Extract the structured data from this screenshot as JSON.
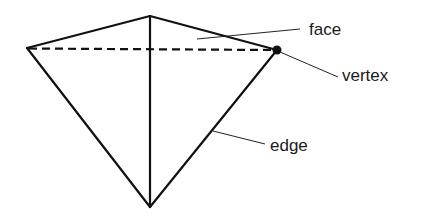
{
  "diagram": {
    "colors": {
      "line": "#111111",
      "text": "#1a1a1a",
      "background": "#ffffff"
    },
    "vertices": {
      "top": [
        150,
        16
      ],
      "left": [
        27,
        48
      ],
      "right": [
        277,
        50
      ],
      "bottom": [
        150,
        207
      ]
    },
    "labels": {
      "face": "face",
      "vertex": "vertex",
      "edge": "edge"
    }
  }
}
